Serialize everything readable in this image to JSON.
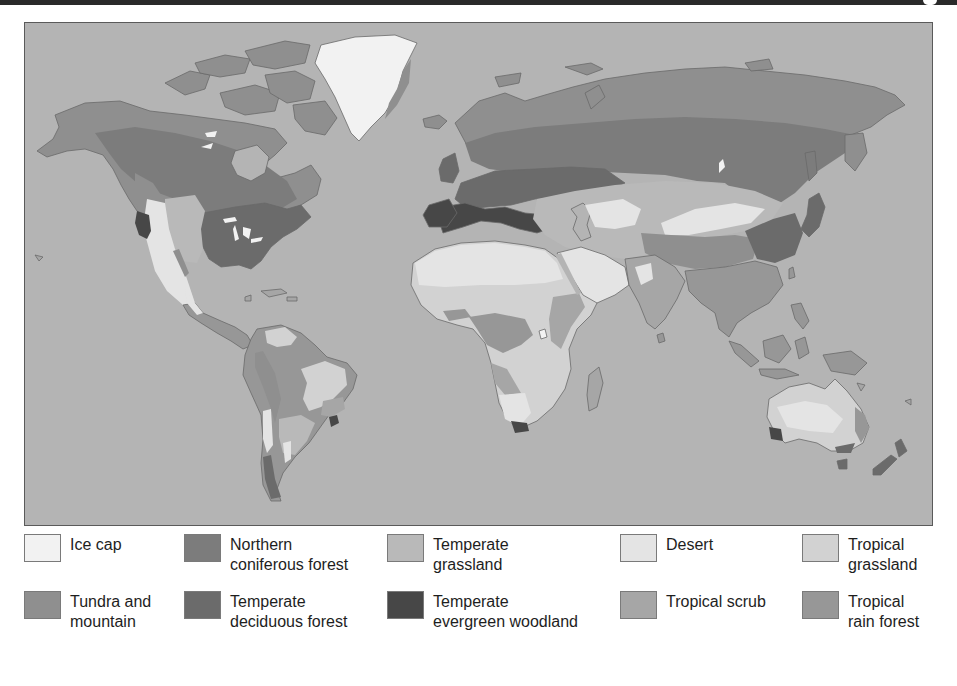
{
  "map": {
    "title": "World biomes map",
    "ocean_color": "#b4b4b4",
    "coast_color": "#6a6a6a"
  },
  "biome_colors": {
    "ice_cap": "#f2f2f2",
    "tundra": "#8f8f8f",
    "coniferous": "#7c7c7c",
    "deciduous": "#6b6b6b",
    "temperate_grassland": "#b9b9b9",
    "evergreen_woodland": "#474747",
    "desert": "#e4e4e4",
    "tropical_scrub": "#a6a6a6",
    "tropical_grassland": "#d2d2d2",
    "rain_forest": "#979797"
  },
  "legend": {
    "items": [
      {
        "id": "ice-cap",
        "label": "Ice cap",
        "color": "#f2f2f2"
      },
      {
        "id": "northern-coniferous-forest",
        "label": "Northern\nconiferous forest",
        "color": "#7c7c7c"
      },
      {
        "id": "temperate-grassland",
        "label": "Temperate\ngrassland",
        "color": "#b9b9b9"
      },
      {
        "id": "desert",
        "label": "Desert",
        "color": "#e4e4e4"
      },
      {
        "id": "tropical-grassland",
        "label": "Tropical\ngrassland",
        "color": "#d2d2d2"
      },
      {
        "id": "tundra-and-mountain",
        "label": "Tundra and\nmountain",
        "color": "#8f8f8f"
      },
      {
        "id": "temperate-deciduous-forest",
        "label": "Temperate\ndeciduous forest",
        "color": "#6b6b6b"
      },
      {
        "id": "temperate-evergreen-woodland",
        "label": "Temperate\nevergreen woodland",
        "color": "#474747"
      },
      {
        "id": "tropical-scrub",
        "label": "Tropical scrub",
        "color": "#a6a6a6"
      },
      {
        "id": "tropical-rain-forest",
        "label": "Tropical\nrain forest",
        "color": "#979797"
      }
    ]
  }
}
